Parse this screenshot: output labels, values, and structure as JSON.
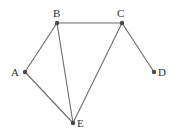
{
  "diagram": {
    "type": "undirected-graph",
    "colors": {
      "edge": "#6b6b6b",
      "node": "#4a4a4a",
      "label": "#333333",
      "background": "#ffffff"
    },
    "nodes": [
      {
        "id": "A",
        "label": "A",
        "x": 25,
        "y": 72,
        "lx": 11,
        "ly": 76,
        "anchor": "start"
      },
      {
        "id": "B",
        "label": "B",
        "x": 57,
        "y": 23,
        "lx": 53,
        "ly": 17,
        "anchor": "start"
      },
      {
        "id": "C",
        "label": "C",
        "x": 122,
        "y": 23,
        "lx": 117,
        "ly": 17,
        "anchor": "start"
      },
      {
        "id": "D",
        "label": "D",
        "x": 154,
        "y": 72,
        "lx": 158,
        "ly": 76,
        "anchor": "start"
      },
      {
        "id": "E",
        "label": "E",
        "x": 73,
        "y": 123,
        "lx": 77,
        "ly": 127,
        "anchor": "start"
      }
    ],
    "edges": [
      {
        "from": "A",
        "to": "B"
      },
      {
        "from": "B",
        "to": "C"
      },
      {
        "from": "B",
        "to": "E"
      },
      {
        "from": "A",
        "to": "E"
      },
      {
        "from": "C",
        "to": "E"
      },
      {
        "from": "C",
        "to": "D"
      }
    ]
  }
}
